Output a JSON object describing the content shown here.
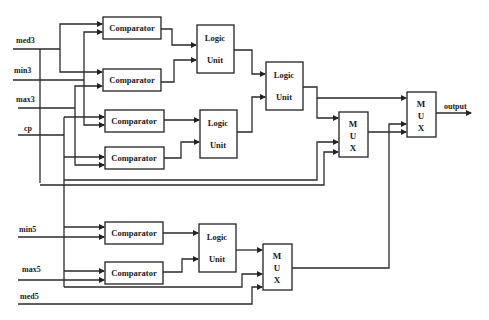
{
  "diagram": {
    "title": "",
    "inputs": {
      "med3": "med3",
      "min3": "min3",
      "max3": "max3",
      "cp": "cp",
      "min5": "min5",
      "max5": "max5",
      "med5": "med5"
    },
    "output_label": "output",
    "comparators": [
      {
        "id": "c1",
        "label": "Comparator"
      },
      {
        "id": "c2",
        "label": "Comparator"
      },
      {
        "id": "c3",
        "label": "Comparator"
      },
      {
        "id": "c4",
        "label": "Comparator"
      },
      {
        "id": "c5",
        "label": "Comparator"
      },
      {
        "id": "c6",
        "label": "Comparator"
      }
    ],
    "logic_units": [
      {
        "id": "l1",
        "line1": "Logic",
        "line2": "Unit"
      },
      {
        "id": "l2",
        "line1": "Logic",
        "line2": "Unit"
      },
      {
        "id": "l3",
        "line1": "Logic",
        "line2": "Unit"
      },
      {
        "id": "l4",
        "line1": "Logic",
        "line2": "Unit"
      }
    ],
    "muxes": [
      {
        "id": "m1",
        "l1": "M",
        "l2": "U",
        "l3": "X"
      },
      {
        "id": "m2",
        "l1": "M",
        "l2": "U",
        "l3": "X"
      },
      {
        "id": "m3",
        "l1": "M",
        "l2": "U",
        "l3": "X"
      }
    ]
  }
}
